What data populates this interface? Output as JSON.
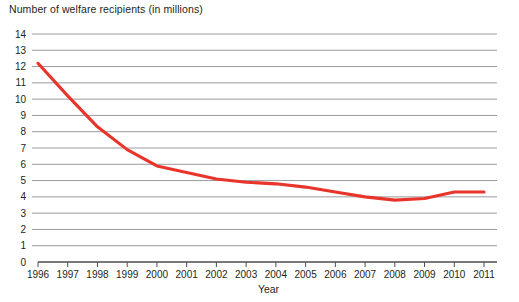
{
  "chart_data": {
    "type": "line",
    "title": "Number of welfare recipients (in millions)",
    "xlabel": "Year",
    "ylabel": "",
    "categories": [
      "1996",
      "1997",
      "1998",
      "1999",
      "2000",
      "2001",
      "2002",
      "2003",
      "2004",
      "2005",
      "2006",
      "2007",
      "2008",
      "2009",
      "2010",
      "2011"
    ],
    "values": [
      12.2,
      10.2,
      8.3,
      6.9,
      5.9,
      5.5,
      5.1,
      4.9,
      4.8,
      4.6,
      4.3,
      4.0,
      3.8,
      3.9,
      4.3,
      4.3
    ],
    "series": [
      {
        "name": "Welfare recipients",
        "color": "#e8342a",
        "values": [
          12.2,
          10.2,
          8.3,
          6.9,
          5.9,
          5.5,
          5.1,
          4.9,
          4.8,
          4.6,
          4.3,
          4.0,
          3.8,
          3.9,
          4.3,
          4.3
        ]
      }
    ],
    "x_tick_labels": [
      "1996",
      "1997",
      "1998",
      "1999",
      "2000",
      "2001",
      "2002",
      "2003",
      "2004",
      "2005",
      "2006",
      "2007",
      "2008",
      "2009",
      "2010",
      "2011"
    ],
    "y_tick_labels": [
      "0",
      "1",
      "2",
      "3",
      "4",
      "5",
      "6",
      "7",
      "8",
      "9",
      "10",
      "11",
      "12",
      "13",
      "14"
    ],
    "y_ticks": [
      0,
      1,
      2,
      3,
      4,
      5,
      6,
      7,
      8,
      9,
      10,
      11,
      12,
      13,
      14
    ],
    "ylim": [
      0,
      14
    ],
    "xlim": [
      "1996",
      "2011"
    ],
    "grid": "horizontal",
    "legend": "none",
    "gridline_color": "#9a9a9a",
    "axis_color": "#4d4d4d",
    "text_color": "#231f20",
    "background_color": "#ffffff"
  }
}
